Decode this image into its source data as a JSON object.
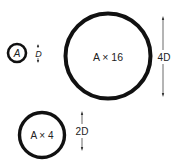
{
  "diagram": {
    "type": "area-scaling-circles",
    "colors": {
      "background": "#ffffff",
      "stroke": "#111111",
      "text": "#222222"
    },
    "circles": [
      {
        "id": "small",
        "label": "A",
        "dimension_label": "D",
        "cx": 17,
        "cy": 53,
        "r": 9,
        "stroke_width": 2.6
      },
      {
        "id": "large",
        "label": "A × 16",
        "dimension_label": "4D",
        "cx": 108,
        "cy": 56,
        "r": 42.5,
        "stroke_width": 4
      },
      {
        "id": "medium",
        "label": "A × 4",
        "dimension_label": "2D",
        "cx": 42,
        "cy": 135,
        "r": 22.5,
        "stroke_width": 3.4
      }
    ]
  }
}
